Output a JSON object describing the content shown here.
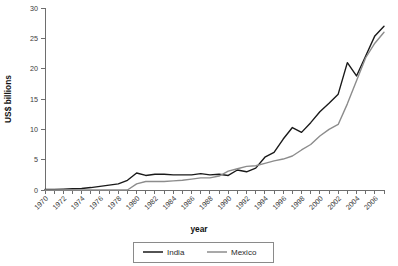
{
  "chart_data": {
    "type": "line",
    "title": "",
    "xlabel": "year",
    "ylabel": "US$ billions",
    "xlim": [
      1970,
      2007
    ],
    "ylim": [
      0,
      30
    ],
    "yticks": [
      0,
      5,
      10,
      15,
      20,
      25,
      30
    ],
    "ytick_labels": [
      "0",
      "5",
      "10",
      "15",
      "20",
      "25",
      "30"
    ],
    "xticks": [
      1970,
      1971,
      1972,
      1973,
      1974,
      1975,
      1976,
      1977,
      1978,
      1979,
      1980,
      1981,
      1982,
      1983,
      1984,
      1985,
      1986,
      1987,
      1988,
      1989,
      1990,
      1991,
      1992,
      1993,
      1994,
      1995,
      1996,
      1997,
      1998,
      1999,
      2000,
      2001,
      2002,
      2003,
      2004,
      2005,
      2006,
      2007
    ],
    "xtick_labels": [
      "1970",
      "1972",
      "1974",
      "1976",
      "1978",
      "1980",
      "1982",
      "1984",
      "1986",
      "1988",
      "1990",
      "1992",
      "1994",
      "1996",
      "1998",
      "2000",
      "2002",
      "2004",
      "2006"
    ],
    "xtick_label_values": [
      1970,
      1972,
      1974,
      1976,
      1978,
      1980,
      1982,
      1984,
      1986,
      1988,
      1990,
      1992,
      1994,
      1996,
      1998,
      2000,
      2002,
      2004,
      2006
    ],
    "grid": false,
    "legend_position": "bottom-center",
    "x": [
      1970,
      1971,
      1972,
      1973,
      1974,
      1975,
      1976,
      1977,
      1978,
      1979,
      1980,
      1981,
      1982,
      1983,
      1984,
      1985,
      1986,
      1987,
      1988,
      1989,
      1990,
      1991,
      1992,
      1993,
      1994,
      1995,
      1996,
      1997,
      1998,
      1999,
      2000,
      2001,
      2002,
      2003,
      2004,
      2005,
      2006,
      2007
    ],
    "series": [
      {
        "name": "India",
        "color": "#1a1a1a",
        "values": [
          0.1,
          0.1,
          0.15,
          0.2,
          0.25,
          0.4,
          0.6,
          0.8,
          1.0,
          1.6,
          2.8,
          2.4,
          2.6,
          2.6,
          2.5,
          2.5,
          2.5,
          2.7,
          2.5,
          2.6,
          2.4,
          3.3,
          3.0,
          3.6,
          5.4,
          6.2,
          8.4,
          10.3,
          9.5,
          11.1,
          12.9,
          14.3,
          15.8,
          21.0,
          18.8,
          22.1,
          25.4,
          27.0
        ]
      },
      {
        "name": "Mexico",
        "color": "#8c8c8c",
        "values": [
          0.0,
          0.0,
          0.0,
          0.0,
          0.0,
          0.0,
          0.0,
          0.0,
          0.0,
          0.0,
          1.0,
          1.4,
          1.4,
          1.4,
          1.5,
          1.6,
          1.8,
          2.0,
          2.0,
          2.3,
          3.1,
          3.5,
          3.9,
          4.0,
          4.4,
          4.8,
          5.1,
          5.6,
          6.6,
          7.5,
          8.9,
          10.0,
          10.8,
          14.2,
          18.0,
          21.8,
          24.2,
          26.0
        ]
      }
    ],
    "legend": [
      "India",
      "Mexico"
    ]
  }
}
